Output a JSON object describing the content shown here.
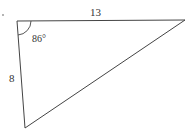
{
  "diagram": {
    "type": "triangle",
    "vertices": {
      "top_left": [
        17,
        21
      ],
      "top_right": [
        185,
        20
      ],
      "bottom": [
        25,
        128
      ]
    },
    "labels": {
      "top_side": "13",
      "left_side": "8",
      "angle": "86°"
    },
    "colors": {
      "stroke": "#444444",
      "text": "#333333",
      "background": "#ffffff"
    }
  }
}
